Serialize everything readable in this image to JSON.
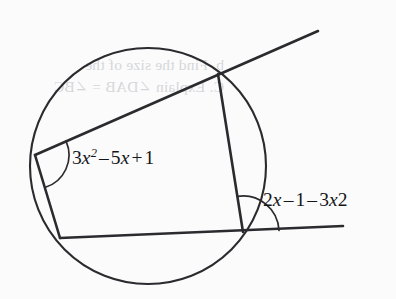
{
  "figure": {
    "background_color": "#fbfbfb",
    "stroke_color": "#2b2b2f",
    "text_color": "#15161a",
    "circle": {
      "center_x": 148,
      "center_y": 166,
      "radius": 118
    },
    "vertices": {
      "left": {
        "x": 35,
        "y": 155,
        "name": "vertex-left"
      },
      "top_right": {
        "x": 218,
        "y": 74,
        "name": "vertex-top-right"
      },
      "bottom_right": {
        "x": 243,
        "y": 232,
        "name": "vertex-bottom-right"
      },
      "bottom_left": {
        "x": 60,
        "y": 238,
        "name": "vertex-bottom-left"
      }
    },
    "lines": {
      "chord_extended": {
        "name": "chord-extended-line",
        "from_x": 35,
        "from_y": 155,
        "to_x": 318,
        "to_y": 31
      },
      "tangent_extended": {
        "name": "tangent-extended-line",
        "from_x": 60,
        "from_y": 238,
        "to_x": 343,
        "to_y": 226
      },
      "left_side": {
        "name": "left-side-segment",
        "from_x": 35,
        "from_y": 155,
        "to_x": 60,
        "to_y": 238
      },
      "right_side": {
        "name": "right-side-segment",
        "from_x": 218,
        "from_y": 74,
        "to_x": 243,
        "to_y": 232
      }
    },
    "angle_arcs": [
      {
        "name": "angle-arc-left",
        "vertex_x": 35,
        "vertex_y": 155,
        "radius": 34,
        "start_angle_deg": -23.7,
        "end_angle_deg": 73.2
      },
      {
        "name": "angle-arc-bottom-right",
        "vertex_x": 243,
        "vertex_y": 232,
        "radius": 36,
        "start_angle_deg": -2.4,
        "end_angle_deg": -99.0
      }
    ]
  },
  "labels": {
    "left_angle": {
      "name": "angle-expression-left",
      "full_text": "3x2 - 5x + 1",
      "coef1": "3",
      "var1": "x",
      "exp1": "2",
      "op1": "–",
      "coef2": "5",
      "var2": "x",
      "op2": "+",
      "const": "1"
    },
    "right_angle": {
      "name": "angle-expression-right",
      "full_text": "2x - 1 - 3x2",
      "coef1": "2",
      "var1": "x",
      "op1": "–",
      "const": "1",
      "op2": "–",
      "coef2": "3",
      "var2": "x",
      "exp2": "2"
    }
  },
  "background_bleed": {
    "line1": "b.  Find the size of the",
    "line2": "C. Explain ∠DAB = ∠BC"
  }
}
